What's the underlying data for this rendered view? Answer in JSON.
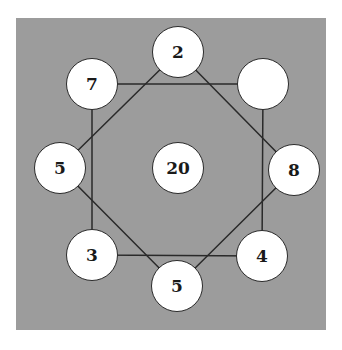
{
  "puzzle": {
    "center": {
      "value": "20",
      "x": 178,
      "y": 168
    },
    "nodes": [
      {
        "id": "top",
        "value": "2",
        "x": 178,
        "y": 52
      },
      {
        "id": "upper-left",
        "value": "7",
        "x": 92,
        "y": 84
      },
      {
        "id": "upper-right",
        "value": "",
        "x": 263,
        "y": 84
      },
      {
        "id": "left",
        "value": "5",
        "x": 60,
        "y": 168
      },
      {
        "id": "right",
        "value": "8",
        "x": 294,
        "y": 170
      },
      {
        "id": "lower-left",
        "value": "3",
        "x": 92,
        "y": 255
      },
      {
        "id": "lower-right",
        "value": "4",
        "x": 262,
        "y": 256
      },
      {
        "id": "bottom",
        "value": "5",
        "x": 177,
        "y": 286
      }
    ],
    "square": [
      "upper-left",
      "upper-right",
      "lower-right",
      "lower-left"
    ],
    "diamond": [
      "top",
      "right",
      "bottom",
      "left"
    ],
    "colors": {
      "background": "#9c9c9c",
      "node_fill": "#ffffff",
      "line": "#2a2a2a"
    }
  }
}
